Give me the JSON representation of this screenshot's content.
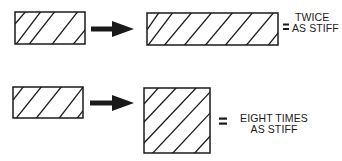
{
  "diagram": {
    "rows": [
      {
        "before": "narrow-beam-rectangle",
        "after": "long-beam-rectangle",
        "equals": "=",
        "result_lines": [
          "TWICE",
          "AS STIFF"
        ]
      },
      {
        "before": "narrow-beam-rectangle",
        "after": "tall-beam-square",
        "equals": "=",
        "result_lines": [
          "EIGHT TIMES",
          "AS STIFF"
        ]
      }
    ],
    "colors": {
      "ink": "#1a1a1a",
      "background": "#ffffff"
    }
  }
}
